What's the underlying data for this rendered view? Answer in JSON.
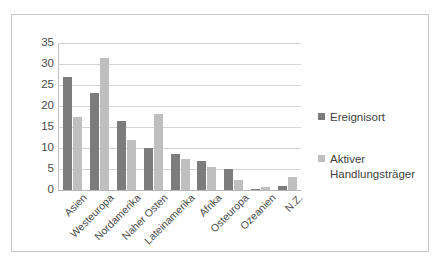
{
  "chart_data": {
    "type": "bar",
    "title": "",
    "subtitle": "",
    "xlabel": "",
    "ylabel": "",
    "ylim": [
      0,
      35
    ],
    "ytick_labels": [
      "35",
      "30",
      "25",
      "20",
      "15",
      "10",
      "5",
      "0"
    ],
    "yticks": [
      35,
      30,
      25,
      20,
      15,
      10,
      5,
      0
    ],
    "grid": true,
    "legend_position": "right",
    "categories": [
      "Asien",
      "Westeuropa",
      "Nordamerika",
      "Naher Osten",
      "Lateinamerika",
      "Afrika",
      "Osteuropa",
      "Ozeanien",
      "N.Z."
    ],
    "series": [
      {
        "name": "Ereignisort",
        "color": "#7c7c7c",
        "values": [
          27,
          23,
          16.5,
          10,
          8.5,
          7,
          5,
          0.3,
          1
        ]
      },
      {
        "name": "Aktiver Handlungsträger",
        "color": "#bfbfbf",
        "values": [
          17.5,
          31.5,
          12,
          18,
          7.5,
          5.5,
          2.5,
          0.8,
          3
        ]
      }
    ]
  },
  "legend": {
    "items": [
      {
        "label": "Ereignisort"
      },
      {
        "label": "Aktiver Handlungsträger"
      }
    ]
  },
  "colors": {
    "series_1": "#7c7c7c",
    "series_2": "#bfbfbf",
    "gridline": "#d4d4d4",
    "frame": "#c6c6c6",
    "text": "#4a4a4a",
    "background": "#ffffff"
  }
}
